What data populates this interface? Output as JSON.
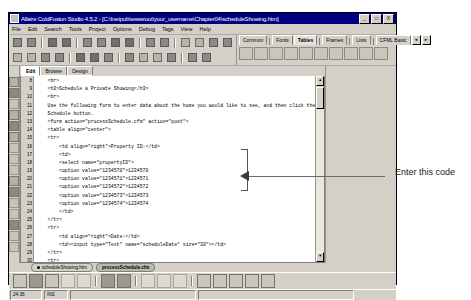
{
  "window": {
    "title": "Allaire ColdFusion Studio 4.5.2 - [C:\\Inetpub\\wwwroot\\your_username\\Chapter04\\scheduleShowing.htm]",
    "minimize": "_",
    "maximize": "□",
    "close": "X"
  },
  "menu": [
    "File",
    "Edit",
    "Search",
    "Tools",
    "Project",
    "Options",
    "Debug",
    "Tags",
    "View",
    "Help"
  ],
  "tag_tabs": [
    {
      "label": "Common",
      "active": false
    },
    {
      "label": "Fonts",
      "active": false
    },
    {
      "label": "Tables",
      "active": true
    },
    {
      "label": "Frames",
      "active": false
    },
    {
      "label": "Lists",
      "active": false
    },
    {
      "label": "CFML Basic",
      "active": false
    }
  ],
  "tag_tabs_scroll": {
    "left": "◄",
    "right": "►"
  },
  "editor_tabs": [
    {
      "label": "Edit",
      "active": true
    },
    {
      "label": "Browse",
      "active": false
    },
    {
      "label": "Design",
      "active": false
    }
  ],
  "editor": {
    "first_line": 8,
    "lines": [
      "    <br>",
      "    <h3>Schedule a Private Showing</h3>",
      "    <br>",
      "    Use the following form to enter data about the home you would like to see, and then click the",
      "    Schedule button.",
      "    <form action=\"processSchedule.cfm\" action=\"post\">",
      "    <table align=\"center\">",
      "    <tr>",
      "        <td align=\"right\">Property ID:</td>",
      "        <td>",
      "        <select name=\"propertyID\">",
      "        <option value=\"1234570\">1234570",
      "        <option value=\"1234571\">1234571",
      "        <option value=\"1234572\">1234572",
      "        <option value=\"1234573\">1234573",
      "        <option value=\"1234574\">1234574",
      "        </td>",
      "    </tr>",
      "    <tr>",
      "        <td align=\"right\">Date:</td>",
      "        <td><input type=\"Text\" name=\"scheduleDate\" size=\"30\"></td>",
      "    </tr>",
      "    <tr>",
      "        <td align=\"right\">Time:</td>",
      "        <td><input type=\"Text\" name=\"scheduleTime\" size=\"30\"></td>"
    ]
  },
  "scrollbar": {
    "up": "▲",
    "down": "▼"
  },
  "document_tabs": [
    {
      "label": "scheduleShowing.htm",
      "active": false
    },
    {
      "label": "processSchedule.cfm",
      "active": true
    }
  ],
  "statusbar": {
    "position": "24:36",
    "mode": "INS",
    "field3": "",
    "field4": ""
  },
  "annotation": {
    "text": "Enter this code"
  }
}
